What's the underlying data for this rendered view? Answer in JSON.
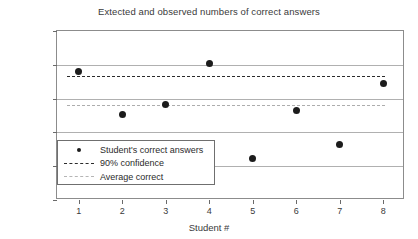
{
  "chart_data": {
    "type": "scatter",
    "title": "Extected and observed numbers of correct answers",
    "xlabel": "Student #",
    "ylabel": "Correct answers",
    "xlim": [
      0.5,
      8.5
    ],
    "ylim": [
      0,
      25
    ],
    "grid": true,
    "legend_position": "inside-bottom-left",
    "x": [
      1,
      2,
      3,
      4,
      5,
      6,
      7,
      8
    ],
    "xticks": [
      "1",
      "2",
      "3",
      "4",
      "5",
      "6",
      "7",
      "8"
    ],
    "yticks": [
      "0",
      "5",
      "10",
      "15",
      "20",
      "25"
    ],
    "series": [
      {
        "name": "Student's correct answers",
        "style": "markers",
        "color": "#1c1c1c",
        "values": [
          19.0,
          12.7,
          14.2,
          20.2,
          6.2,
          13.2,
          8.2,
          17.3
        ]
      },
      {
        "name": "90% confidence",
        "style": "dashed-line",
        "color": "#2b2b2b",
        "value": 18.4
      },
      {
        "name": "Average correct",
        "style": "dash-dot-line",
        "color": "#adadad",
        "value": 14.0
      }
    ]
  },
  "legend": {
    "items": [
      {
        "label": "Student's correct answers",
        "key": "marker-dot"
      },
      {
        "label": "90% confidence",
        "key": "dashed-line"
      },
      {
        "label": "Average correct",
        "key": "dash-dot-line"
      }
    ]
  }
}
